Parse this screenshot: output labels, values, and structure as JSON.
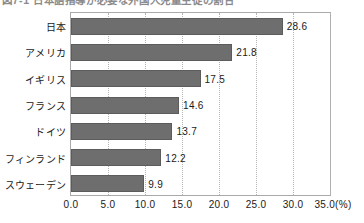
{
  "figure": {
    "caption": "図7-1 日本語指導が必要な外国人児童生徒の割合",
    "caption_clipped": true
  },
  "chart_data": {
    "type": "bar",
    "orientation": "horizontal",
    "title": "",
    "xlabel": "(%)",
    "ylabel": "",
    "categories": [
      "日本",
      "アメリカ",
      "イギリス",
      "フランス",
      "ドイツ",
      "フィンランド",
      "スウェーデン"
    ],
    "values": [
      28.6,
      21.8,
      17.5,
      14.6,
      13.7,
      12.2,
      9.9
    ],
    "value_labels": [
      "28.6",
      "21.8",
      "17.5",
      "14.6",
      "13.7",
      "12.2",
      "9.9"
    ],
    "xlim": [
      0.0,
      35.0
    ],
    "xticks": [
      0.0,
      5.0,
      10.0,
      15.0,
      20.0,
      25.0,
      30.0,
      35.0
    ],
    "xtick_labels": [
      "0.0",
      "5.0",
      "10.0",
      "15.0",
      "20.0",
      "25.0",
      "30.0",
      "35.0"
    ],
    "x_unit_suffix": "(%)",
    "grid": true,
    "grid_style": "dotted-vertical",
    "legend": null,
    "bar_color": "#6e6e6e",
    "bar_edge_color": "#5c5c5c",
    "grid_color": "#b5b5b5",
    "frame_color": "#a9a9a9",
    "background": "#ffffff"
  }
}
